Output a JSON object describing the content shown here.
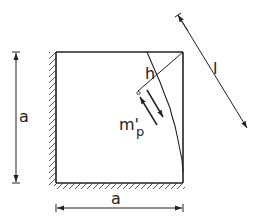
{
  "diagram": {
    "type": "mechanics-plate-yield-line",
    "labels": {
      "left_dimension": "a",
      "bottom_dimension": "a",
      "perpendicular_distance": "h",
      "length": "l",
      "moment": "m'",
      "moment_subscript": "p"
    },
    "colors": {
      "stroke": "#222222",
      "background": "#ffffff"
    }
  }
}
